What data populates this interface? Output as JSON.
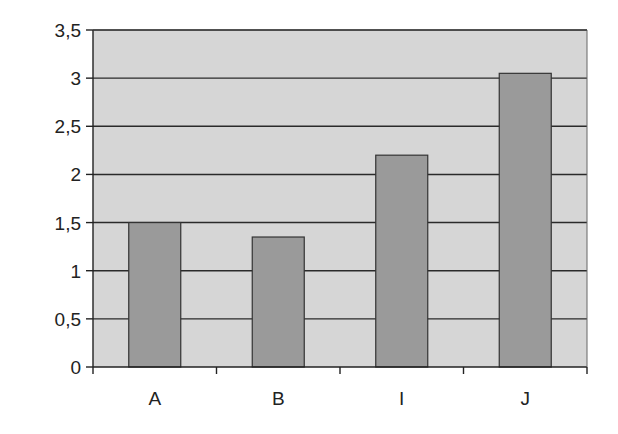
{
  "chart_data": {
    "type": "bar",
    "title": "",
    "xlabel": "",
    "ylabel": "",
    "categories": [
      "A",
      "B",
      "I",
      "J"
    ],
    "values": [
      1.5,
      1.35,
      2.2,
      3.05
    ],
    "ylim": [
      0,
      3.5
    ],
    "yticks": [
      0,
      0.5,
      1,
      1.5,
      2,
      2.5,
      3,
      3.5
    ],
    "ytick_labels": [
      "0",
      "0,5",
      "1",
      "1,5",
      "2",
      "2,5",
      "3",
      "3,5"
    ],
    "grid": true,
    "legend": "none",
    "colors": {
      "plot_background": "#d6d6d6",
      "bar_fill": "#9a9a9a",
      "bar_stroke": "#333333",
      "gridline": "#2a2a2a"
    }
  }
}
